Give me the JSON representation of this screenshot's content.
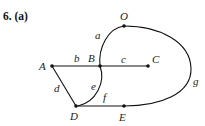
{
  "title": "6. (a)",
  "graph": {
    "vertices": [
      {
        "id": "O",
        "x": 124,
        "y": 26
      },
      {
        "id": "A",
        "x": 52,
        "y": 66
      },
      {
        "id": "B",
        "x": 100,
        "y": 66
      },
      {
        "id": "C",
        "x": 148,
        "y": 66
      },
      {
        "id": "D",
        "x": 76,
        "y": 106
      },
      {
        "id": "E",
        "x": 124,
        "y": 106
      }
    ],
    "edges": [
      {
        "label": "a",
        "from": "B",
        "to": "O"
      },
      {
        "label": "b",
        "from": "A",
        "to": "B"
      },
      {
        "label": "c",
        "from": "B",
        "to": "C"
      },
      {
        "label": "d",
        "from": "A",
        "to": "D"
      },
      {
        "label": "e",
        "from": "B",
        "to": "D"
      },
      {
        "label": "f",
        "from": "D",
        "to": "E"
      },
      {
        "label": "g",
        "from": "O",
        "to": "E"
      }
    ]
  },
  "labels": {
    "O": "O",
    "A": "A",
    "B": "B",
    "C": "C",
    "D": "D",
    "E": "E",
    "a": "a",
    "b": "b",
    "c": "c",
    "d": "d",
    "e": "e",
    "f": "f",
    "g": "g"
  }
}
